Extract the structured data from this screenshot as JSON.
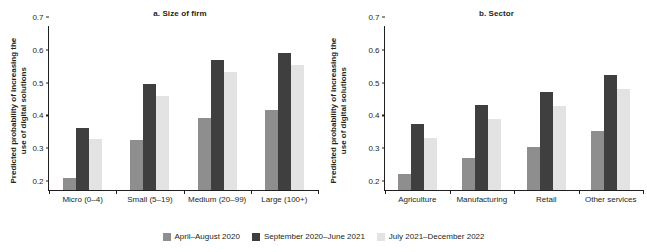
{
  "figure": {
    "background": "#ffffff",
    "series_colors": {
      "april_august_2020": "#8e8e8e",
      "september_2020_june_2021": "#3f3f3f",
      "july_2021_december_2022": "#e3e3e3"
    }
  },
  "legend": {
    "position": "bottom-center",
    "items": [
      {
        "label": "April–August 2020",
        "color": "#8e8e8e"
      },
      {
        "label": "September 2020–June 2021",
        "color": "#3f3f3f"
      },
      {
        "label": "July 2021–December 2022",
        "color": "#e3e3e3"
      }
    ]
  },
  "chart_data": [
    {
      "type": "bar",
      "title": "a. Size of firm",
      "xlabel": "",
      "ylabel": "Predicted probability of increasing the\nuse of digital solutions",
      "ylim": [
        0.2,
        0.7
      ],
      "yticks": [
        0.2,
        0.3,
        0.4,
        0.5,
        0.6,
        0.7
      ],
      "ytick_labels": [
        "0.2",
        "0.3",
        "0.4",
        "0.5",
        "0.6",
        "0.7"
      ],
      "grid": false,
      "legend_position": "bottom-center",
      "categories": [
        "Micro (0–4)",
        "Small (5–19)",
        "Medium (20–99)",
        "Large (100+)"
      ],
      "series": [
        {
          "name": "April–August 2020",
          "color": "#8e8e8e",
          "values": [
            0.237,
            0.352,
            0.42,
            0.445
          ]
        },
        {
          "name": "September 2020–June 2021",
          "color": "#3f3f3f",
          "values": [
            0.39,
            0.524,
            0.595,
            0.618
          ]
        },
        {
          "name": "July 2021–December 2022",
          "color": "#e3e3e3",
          "values": [
            0.356,
            0.488,
            0.56,
            0.582
          ]
        }
      ]
    },
    {
      "type": "bar",
      "title": "b. Sector",
      "xlabel": "",
      "ylabel": "Predicted probability of increasing the\nuse of digital solutions",
      "ylim": [
        0.2,
        0.7
      ],
      "yticks": [
        0.2,
        0.3,
        0.4,
        0.5,
        0.6,
        0.7
      ],
      "ytick_labels": [
        "0.2",
        "0.3",
        "0.4",
        "0.5",
        "0.6",
        "0.7"
      ],
      "grid": false,
      "legend_position": "bottom-center",
      "categories": [
        "Agriculture",
        "Manufacturing",
        "Retail",
        "Other services"
      ],
      "series": [
        {
          "name": "April–August 2020",
          "color": "#8e8e8e",
          "values": [
            0.248,
            0.298,
            0.332,
            0.381
          ]
        },
        {
          "name": "September 2020–June 2021",
          "color": "#3f3f3f",
          "values": [
            0.4,
            0.46,
            0.498,
            0.551
          ]
        },
        {
          "name": "July 2021–December 2022",
          "color": "#e3e3e3",
          "values": [
            0.36,
            0.418,
            0.455,
            0.508
          ]
        }
      ]
    }
  ]
}
